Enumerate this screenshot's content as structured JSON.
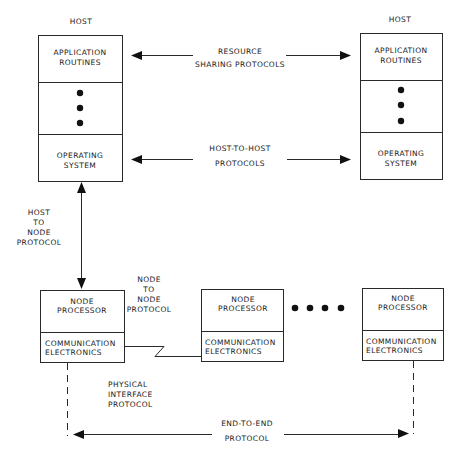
{
  "diagram": {
    "type": "network-protocol-layers",
    "colors": {
      "line": "#2a2a2a",
      "background": "#ffffff",
      "text": "#1a1a1a"
    },
    "hosts": [
      {
        "label": "HOST",
        "layers": [
          {
            "line1": "APPLICATION",
            "line2": "ROUTINES"
          },
          {
            "ellipsis": "vertical-dots"
          },
          {
            "line1": "OPERATING",
            "line2": "SYSTEM"
          }
        ]
      },
      {
        "label": "HOST",
        "layers": [
          {
            "line1": "APPLICATION",
            "line2": "ROUTINES"
          },
          {
            "ellipsis": "vertical-dots"
          },
          {
            "line1": "OPERATING",
            "line2": "SYSTEM"
          }
        ]
      }
    ],
    "host_protocols": [
      {
        "line1": "RESOURCE",
        "line2": "SHARING PROTOCOLS"
      },
      {
        "line1": "HOST-TO-HOST",
        "line2": "PROTOCOLS"
      }
    ],
    "host_to_node": {
      "line1": "HOST",
      "line2": "TO",
      "line3": "NODE",
      "line4": "PROTOCOL"
    },
    "node_to_node": {
      "line1": "NODE",
      "line2": "TO",
      "line3": "NODE",
      "line4": "PROTOCOL"
    },
    "nodes": [
      {
        "top1": "NODE",
        "top2": "PROCESSOR",
        "bottom1": "COMMUNICATION",
        "bottom2": "ELECTRONICS"
      },
      {
        "top1": "NODE",
        "top2": "PROCESSOR",
        "bottom1": "COMMUNICATION",
        "bottom2": "ELECTRONICS"
      },
      {
        "top1": "NODE",
        "top2": "PROCESSOR",
        "bottom1": "COMMUNICATION",
        "bottom2": "ELECTRONICS"
      }
    ],
    "physical_interface": {
      "line1": "PHYSICAL",
      "line2": "INTERFACE",
      "line3": "PROTOCOL"
    },
    "end_to_end": {
      "line1": "END-TO-END",
      "line2": "PROTOCOL"
    }
  }
}
